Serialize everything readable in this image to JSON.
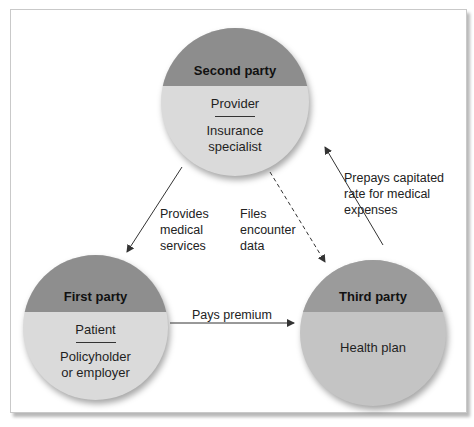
{
  "colors": {
    "header_fill": "#8e8e8e",
    "body_fill": "#d9d9d9",
    "third_body_fill": "#c6c6c6",
    "third_header_fill": "#9a9a9a",
    "arrow": "#333333"
  },
  "parties": {
    "second": {
      "title": "Second party",
      "role": "Provider",
      "description_line1": "Insurance",
      "description_line2": "specialist"
    },
    "first": {
      "title": "First party",
      "role": "Patient",
      "description_line1": "Policyholder",
      "description_line2": "or employer"
    },
    "third": {
      "title": "Third party",
      "description_line1": "Health plan"
    }
  },
  "flows": {
    "provides": {
      "line1": "Provides",
      "line2": "medical",
      "line3": "services"
    },
    "files": {
      "line1": "Files",
      "line2": "encounter",
      "line3": "data"
    },
    "prepays": {
      "line1": "Prepays capitated",
      "line2": "rate for medical",
      "line3": "expenses"
    },
    "pays": {
      "line1": "Pays premium"
    }
  }
}
